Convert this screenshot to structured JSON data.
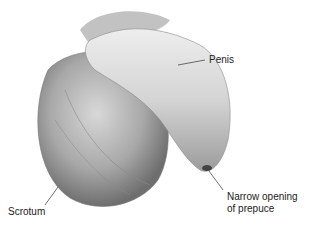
{
  "figure": {
    "type": "anatomical illustration",
    "labels": [
      {
        "id": "penis",
        "text": "Penis"
      },
      {
        "id": "opening",
        "line1": "Narrow opening",
        "line2": "of prepuce"
      },
      {
        "id": "scrotum",
        "text": "Scrotum"
      }
    ]
  }
}
